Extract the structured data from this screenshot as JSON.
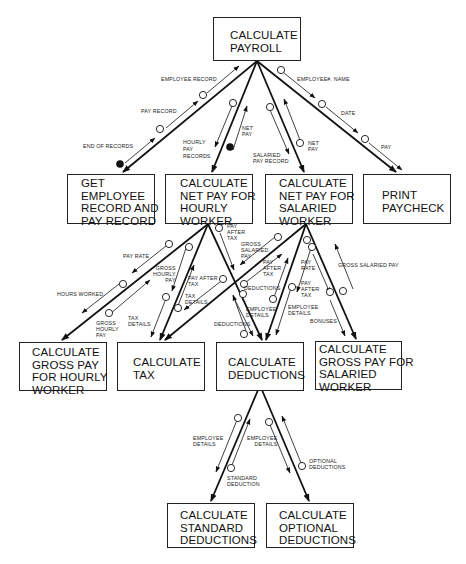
{
  "diagram": {
    "modules": {
      "root": "CALCULATE\nPAYROLL",
      "get_employee": "GET\nEMPLOYEE\nRECORD AND\nPAY RECORD",
      "net_hourly": "CALCULATE\nNET PAY FOR\nHOURLY\nWORKER",
      "net_salaried": "CALCULATE\nNET PAY FOR\nSALARIED\nWORKER",
      "print_paycheck": "PRINT\nPAYCHECK",
      "gross_hourly": "CALCULATE\nGROSS PAY\nFOR HOURLY\nWORKER",
      "calc_tax": "CALCULATE\nTAX",
      "calc_deductions": "CALCULATE\nDEDUCTIONS",
      "gross_salaried": "CALCULATE\nGROSS PAY FOR\nSALARIED\nWORKER",
      "standard_deductions": "CALCULATE\nSTANDARD\nDEDUCTIONS",
      "optional_deductions": "CALCULATE\nOPTIONAL\nDEDUCTIONS"
    },
    "couples": {
      "employee_record": "EMPLOYEE RECORD",
      "pay_record": "PAY RECORD",
      "end_of_records": "END OF RECORDS",
      "hourly_pay_records": "HOURLY\nPAY\nRECORDS",
      "net_pay_hourly": "NET\nPAY",
      "salaried_pay_record": "SALARIED\nPAY RECORD",
      "net_pay_salaried": "NET\nPAY",
      "employee_no_name": "EMPLOYEE#, NAME",
      "date": "DATE",
      "pay": "PAY",
      "pay_rate_hourly": "PAY RATE",
      "hours_worked": "HOURS WORKED",
      "gross_hourly_pay_up": "GROSS\nHOURLY\nPAY",
      "gross_hourly_pay_down": "GROSS\nHOURLY\nPAY",
      "tax_details_h": "TAX\nDETAILS",
      "pay_after_tax_h1": "PAY AFTER\nTAX",
      "tax_details_s": "TAX\nDETAILS",
      "pay_after_tax_h2": "PAY\nAFTER\nTAX",
      "deductions_h": "DEDUCTIONS",
      "gross_salaried_pay_tax": "GROSS\nSALARIED\nPAY",
      "pay_after_tax_s1": "PAY\nAFTER\nTAX",
      "deductions_s": "DEDUCTIONS",
      "employee_details_h": "EMPLOYEE\nDETAILS",
      "employee_details_s": "EMPLOYEE\nDETAILS",
      "pay_rate_s": "PAY\nRATE",
      "pay_after_tax_s2": "PAY\nAFTER\nTAX",
      "bonuses": "BONUSES",
      "gross_salaried_pay": "GROSS SALARIED PAY",
      "employee_details_std": "EMPLOYEE\nDETAILS",
      "standard_deduction": "STANDARD\nDEDUCTION",
      "employee_details_opt": "EMPLOYEE\nDETAILS",
      "optional_deductions": "OPTIONAL\nDEDUCTIONS"
    },
    "colors": {
      "line": "#111111",
      "background": "#ffffff"
    }
  }
}
